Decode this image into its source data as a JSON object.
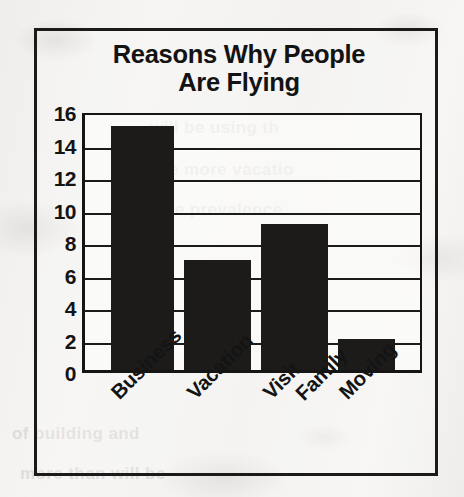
{
  "chart_data": {
    "type": "bar",
    "title": "Reasons Why People Are Flying",
    "title_line1": "Reasons Why People",
    "title_line2": "Are Flying",
    "xlabel": "",
    "ylabel": "",
    "categories": [
      "Business",
      "Vacation",
      "Visit Family",
      "Moving"
    ],
    "values": [
      15,
      6.8,
      9,
      1.9
    ],
    "ylim": [
      0,
      16
    ],
    "ytick_labels": [
      "0",
      "2",
      "4",
      "6",
      "8",
      "10",
      "12",
      "14",
      "16"
    ],
    "ytick_values": [
      0,
      2,
      4,
      6,
      8,
      10,
      12,
      14,
      16
    ],
    "grid": true,
    "grid_orientation": "horizontal",
    "legend": false,
    "legend_position": "none",
    "bar_color": "#1c1b1a",
    "plot_background": "#fdfdfc",
    "axis_color": "#151515",
    "annotations": []
  },
  "chart": {
    "border_color": "#1a1a1a",
    "page_background": "#f4f3f1",
    "category_labels": [
      {
        "line1": "Business",
        "line2": ""
      },
      {
        "line1": "Vacation",
        "line2": ""
      },
      {
        "line1": "Visit",
        "line2": "Family"
      },
      {
        "line1": "Moving",
        "line2": ""
      }
    ]
  },
  "page_bleed_through": [
    "will be using th",
    "re more vacatio",
    "p the prevalence",
    "of building and",
    "more than will be"
  ]
}
